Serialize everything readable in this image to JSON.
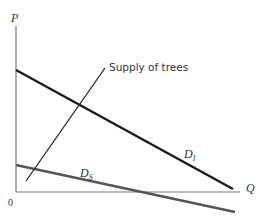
{
  "diagram": {
    "type": "supply-demand",
    "axes": {
      "y_label": "P",
      "x_label": "Q",
      "origin_label": "0"
    },
    "curves": [
      {
        "id": "Di",
        "label_main": "D",
        "label_sub": "I",
        "color": "#1a1a1a",
        "description": "Industrial demand curve (downward sloping, higher)"
      },
      {
        "id": "Ds",
        "label_main": "D",
        "label_sub": "S",
        "color": "#555555",
        "description": "Demand curve (downward sloping, lower)"
      },
      {
        "id": "supply",
        "label": "Supply of trees",
        "color": "#222222",
        "description": "Upward sloping supply curve"
      }
    ],
    "colors": {
      "axis": "#777777",
      "background": "#ffffff"
    }
  }
}
